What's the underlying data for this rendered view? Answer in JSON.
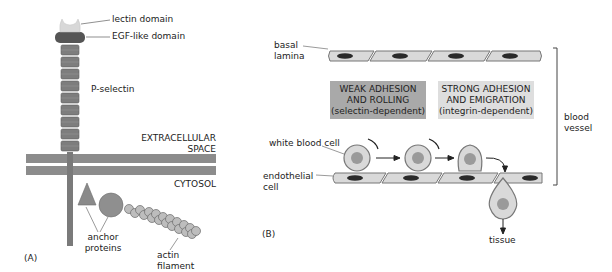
{
  "panel_a": {
    "label": "(A)",
    "lectin_domain": "lectin domain",
    "egf_domain": "EGF-like domain",
    "p_selectin": "P-selectin",
    "extracellular_line1": "EXTRACELLULAR",
    "extracellular_line2": "SPACE",
    "cytosol": "CYTOSOL",
    "anchor_line1": "anchor",
    "anchor_line2": "proteins",
    "actin_line1": "actin",
    "actin_line2": "filament"
  },
  "panel_b": {
    "label": "(B)",
    "basal_line1": "basal",
    "basal_line2": "lamina",
    "weak_box": {
      "line1": "WEAK ADHESION",
      "line2": "AND ROLLING",
      "line3": "(selectin-dependent)"
    },
    "strong_box": {
      "line1": "STRONG ADHESION",
      "line2": "AND EMIGRATION",
      "line3": "(integrin-dependent)"
    },
    "white_blood_cell": "white blood cell",
    "endothelial_line1": "endothelial",
    "endothelial_line2": "cell",
    "blood_line1": "blood",
    "blood_line2": "vessel",
    "tissue": "tissue"
  },
  "colors": {
    "membrane": "#8c8c8c",
    "segment": "#7a7a7a",
    "egf": "#555555",
    "lectin": "#d8d8d8",
    "cell_fill": "#d9d9d9",
    "cell_stroke": "#777777",
    "nucleus": "#9a9a9a",
    "endo_nucleus": "#2a2a2a",
    "weak_box": "#a9a9a9",
    "strong_box": "#dedede"
  }
}
